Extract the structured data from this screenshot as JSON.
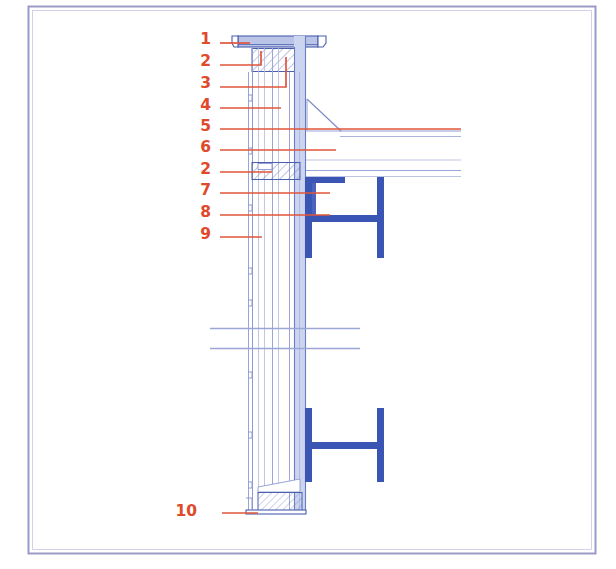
{
  "drawing": {
    "type": "architectural-section-detail",
    "title": "Curtain wall / parapet vertical section detail",
    "canvas": {
      "width": 616,
      "height": 569,
      "background": "#ffffff"
    },
    "frame": {
      "name": "drawing-border",
      "x": 28,
      "y": 6,
      "width": 567,
      "height": 547,
      "stroke": "#8f8fc0",
      "fill": "#ffffff"
    },
    "colors": {
      "callout": "#e0492a",
      "leader": "#e0553a",
      "line_dark_blue": "#3a55a8",
      "steel_blue": "#3a55b4",
      "line_light_blue": "#9aa6d8",
      "line_pale_blue": "#b9c2e2",
      "hatch_blue": "#6f7fc4",
      "wall_fill": "#cdd5ee",
      "white": "#ffffff"
    },
    "callouts": [
      {
        "id": "c1",
        "number": "1",
        "x": 211,
        "y": 44,
        "leader_y": 43,
        "leader_x_start": 220,
        "leader_x_end": 250,
        "jog": null
      },
      {
        "id": "c2a",
        "number": "2",
        "x": 211,
        "y": 66,
        "leader_y": 65,
        "leader_x_start": 220,
        "leader_x_end": 261,
        "jog": {
          "x": 261,
          "y_to": 51
        }
      },
      {
        "id": "c3",
        "number": "3",
        "x": 211,
        "y": 88,
        "leader_y": 87,
        "leader_x_start": 220,
        "leader_x_end": 286,
        "jog": {
          "x": 286,
          "y_to": 57
        }
      },
      {
        "id": "c4",
        "number": "4",
        "x": 211,
        "y": 110,
        "leader_y": 108,
        "leader_x_start": 220,
        "leader_x_end": 281,
        "jog": null
      },
      {
        "id": "c5",
        "number": "5",
        "x": 211,
        "y": 131,
        "leader_y": 129,
        "leader_x_start": 220,
        "leader_x_end": 461,
        "jog": null
      },
      {
        "id": "c6",
        "number": "6",
        "x": 211,
        "y": 152,
        "leader_y": 150,
        "leader_x_start": 220,
        "leader_x_end": 336,
        "jog": null
      },
      {
        "id": "c2b",
        "number": "2",
        "x": 211,
        "y": 174,
        "leader_y": 172,
        "leader_x_start": 220,
        "leader_x_end": 272,
        "jog": null
      },
      {
        "id": "c7",
        "number": "7",
        "x": 211,
        "y": 195,
        "leader_y": 193,
        "leader_x_start": 220,
        "leader_x_end": 330,
        "jog": null
      },
      {
        "id": "c8",
        "number": "8",
        "x": 211,
        "y": 217,
        "leader_y": 215,
        "leader_x_start": 220,
        "leader_x_end": 330,
        "jog": null
      },
      {
        "id": "c9",
        "number": "9",
        "x": 211,
        "y": 239,
        "leader_y": 237,
        "leader_x_start": 220,
        "leader_x_end": 262,
        "jog": null
      },
      {
        "id": "c10",
        "number": "10",
        "x": 197,
        "y": 516,
        "leader_y": 513,
        "leader_x_start": 222,
        "leader_x_end": 258,
        "jog": null
      }
    ],
    "geometry": {
      "coping": {
        "name": "parapet-coping-cap",
        "top_y": 36,
        "bottom_y": 48,
        "left_x": 238,
        "right_x": 318,
        "drip_left_x": 232,
        "drip_right_x": 324,
        "fill": "#b9c4e6"
      },
      "parapet_block": {
        "name": "parapet-hatched-block",
        "x": 252,
        "y": 49,
        "width": 48,
        "height": 23
      },
      "wall_column": {
        "name": "mullion-column",
        "x": 294,
        "y": 48,
        "width": 12,
        "height": 462,
        "fill": "#ccd4ee"
      },
      "wall_layers_x": [
        248,
        252,
        258,
        264,
        272,
        278,
        290
      ],
      "wall_top_y": 48,
      "wall_bottom_y": 512,
      "roof_slope": {
        "name": "roof-slope-line",
        "points": "306,100 306,131 340,131"
      },
      "roof_lines": [
        {
          "name": "roof-line-upper",
          "y": 131,
          "x1": 306,
          "x2": 461
        },
        {
          "name": "roof-line-lower",
          "y": 136,
          "x1": 340,
          "x2": 461
        },
        {
          "name": "ceiling-line-1",
          "y": 160,
          "x1": 306,
          "x2": 461
        },
        {
          "name": "ceiling-line-2",
          "y": 170,
          "x1": 306,
          "x2": 461
        },
        {
          "name": "ceiling-line-3",
          "y": 176,
          "x1": 306,
          "x2": 461
        }
      ],
      "slab_block": {
        "name": "floor-slab-hatched",
        "x": 252,
        "y": 162,
        "width": 48,
        "height": 17
      },
      "beam_upper": {
        "name": "steel-i-beam-upper",
        "left_flange_x": 305,
        "right_flange_x": 378,
        "top_y": 178,
        "bottom_y": 258,
        "web_y": 218,
        "flange_w": 7,
        "web_h": 7,
        "top_plate": {
          "x1": 305,
          "x2": 345,
          "y": 180
        },
        "stiffener": {
          "x": 312,
          "y1": 182,
          "y2": 216
        }
      },
      "beam_lower": {
        "name": "steel-i-beam-lower",
        "left_flange_x": 305,
        "right_flange_x": 378,
        "top_y": 408,
        "bottom_y": 482,
        "web_y": 445,
        "flange_w": 7,
        "web_h": 7
      },
      "break_lines": [
        {
          "name": "section-break-upper",
          "y": 328,
          "x1": 210,
          "x2": 360
        },
        {
          "name": "section-break-lower",
          "y": 348,
          "x1": 210,
          "x2": 360
        }
      ],
      "sill_block": {
        "name": "sill-hatched-block",
        "x": 258,
        "y": 492,
        "width": 44,
        "height": 18
      },
      "sill_base": {
        "name": "sill-base-plate",
        "x": 248,
        "y": 510,
        "width": 58,
        "height": 4
      }
    }
  }
}
